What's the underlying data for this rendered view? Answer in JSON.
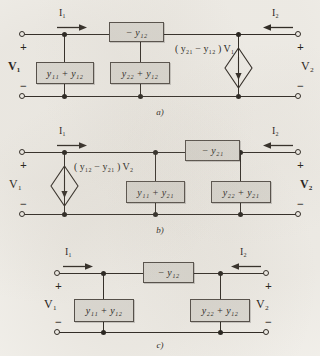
{
  "figure": {
    "type": "two-port-equivalent-circuits"
  },
  "circuits": [
    {
      "id": "a",
      "caption": "a)",
      "left_current": "I",
      "left_current_sub": "1",
      "right_current": "I",
      "right_current_sub": "2",
      "left_voltage": "V",
      "left_voltage_sub": "1",
      "left_voltage_bold": true,
      "right_voltage": "V",
      "right_voltage_sub": "2",
      "right_voltage_bold": false,
      "plus": "+",
      "minus": "−",
      "series_box": "− y",
      "series_box_sub": "12",
      "shunt_left_box": "y₁₁ + y₁₂",
      "shunt_right_box": "y₂₂ + y₁₂",
      "has_source": true,
      "source_label": "( y₂₁ − y₁₂ ) V₁",
      "source_type": "dependent-current-source",
      "source_arrow": "down"
    },
    {
      "id": "b",
      "caption": "b)",
      "left_current": "I",
      "left_current_sub": "1",
      "right_current": "I",
      "right_current_sub": "2",
      "left_voltage": "V",
      "left_voltage_sub": "1",
      "left_voltage_bold": false,
      "right_voltage": "V",
      "right_voltage_sub": "2",
      "right_voltage_bold": true,
      "plus": "+",
      "minus": "−",
      "series_box": "− y",
      "series_box_sub": "21",
      "shunt_left_box": "y₁₁ + y₂₁",
      "shunt_right_box": "y₂₂ + y₂₁",
      "has_source": true,
      "source_label": "( y₁₂ − y₂₁ ) V₂",
      "source_type": "dependent-current-source",
      "source_arrow": "down"
    },
    {
      "id": "c",
      "caption": "c)",
      "left_current": "I",
      "left_current_sub": "1",
      "right_current": "I",
      "right_current_sub": "2",
      "left_voltage": "V",
      "left_voltage_sub": "1",
      "left_voltage_bold": false,
      "right_voltage": "V",
      "right_voltage_sub": "2",
      "right_voltage_bold": false,
      "plus": "+",
      "minus": "−",
      "series_box": "− y",
      "series_box_sub": "12",
      "shunt_left_box": "y₁₁ + y₁₂",
      "shunt_right_box": "y₂₂ + y₁₂",
      "has_source": false,
      "source_label": "",
      "source_type": "none",
      "source_arrow": ""
    }
  ],
  "colors": {
    "paper": "#f3f1ec",
    "ink": "#241f1a",
    "component_fill": "#dedcd6",
    "component_border": "#4a4540"
  }
}
